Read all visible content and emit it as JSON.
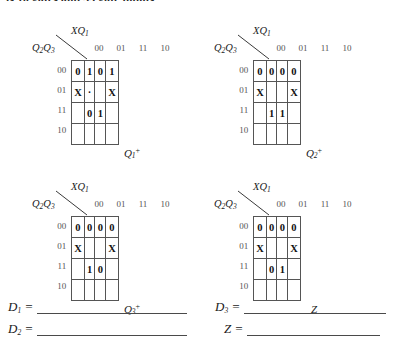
{
  "page": {
    "top_cut_text": "is 10 gates and 33 gate inputs."
  },
  "kmaps": [
    {
      "name": "q1-next",
      "top_var": "XQ",
      "top_var_sub": "1",
      "left_var_a": "Q",
      "left_var_a_sub": "2",
      "left_var_b": "Q",
      "left_var_b_sub": "3",
      "col_heads": [
        "00",
        "01",
        "11",
        "10"
      ],
      "row_heads": [
        "00",
        "01",
        "11",
        "10"
      ],
      "cells": [
        [
          "0",
          "1",
          "0",
          "1"
        ],
        [
          "X",
          "·",
          "",
          "X"
        ],
        [
          "",
          "0",
          "1",
          ""
        ],
        [
          "",
          "",
          "",
          ""
        ]
      ],
      "faint": [
        [
          0,
          0,
          0,
          0
        ],
        [
          0,
          1,
          0,
          0
        ],
        [
          0,
          0,
          0,
          0
        ],
        [
          0,
          0,
          0,
          0
        ]
      ],
      "caption": "Q",
      "caption_sub": "1",
      "caption_sup": "+"
    },
    {
      "name": "q2-next",
      "top_var": "XQ",
      "top_var_sub": "1",
      "left_var_a": "Q",
      "left_var_a_sub": "2",
      "left_var_b": "Q",
      "left_var_b_sub": "3",
      "col_heads": [
        "00",
        "01",
        "11",
        "10"
      ],
      "row_heads": [
        "00",
        "01",
        "11",
        "10"
      ],
      "cells": [
        [
          "0",
          "0",
          "0",
          "0"
        ],
        [
          "X",
          "",
          "",
          "X"
        ],
        [
          "",
          "1",
          "1",
          ""
        ],
        [
          "",
          "",
          "",
          ""
        ]
      ],
      "faint": [
        [
          0,
          0,
          0,
          0
        ],
        [
          0,
          0,
          0,
          0
        ],
        [
          0,
          0,
          0,
          0
        ],
        [
          0,
          0,
          0,
          0
        ]
      ],
      "caption": "Q",
      "caption_sub": "2",
      "caption_sup": "+"
    },
    {
      "name": "q3-next",
      "top_var": "XQ",
      "top_var_sub": "1",
      "left_var_a": "Q",
      "left_var_a_sub": "2",
      "left_var_b": "Q",
      "left_var_b_sub": "3",
      "col_heads": [
        "00",
        "01",
        "11",
        "10"
      ],
      "row_heads": [
        "00",
        "01",
        "11",
        "10"
      ],
      "cells": [
        [
          "0",
          "0",
          "0",
          "0"
        ],
        [
          "X",
          "",
          "",
          "X"
        ],
        [
          "",
          "1",
          "0",
          ""
        ],
        [
          "",
          "",
          "",
          ""
        ]
      ],
      "faint": [
        [
          0,
          0,
          0,
          0
        ],
        [
          0,
          0,
          0,
          0
        ],
        [
          0,
          0,
          0,
          0
        ],
        [
          0,
          0,
          0,
          0
        ]
      ],
      "caption": "Q",
      "caption_sub": "3",
      "caption_sup": "+"
    },
    {
      "name": "z-output",
      "top_var": "XQ",
      "top_var_sub": "1",
      "left_var_a": "Q",
      "left_var_a_sub": "2",
      "left_var_b": "Q",
      "left_var_b_sub": "3",
      "col_heads": [
        "00",
        "01",
        "11",
        "10"
      ],
      "row_heads": [
        "00",
        "01",
        "11",
        "10"
      ],
      "cells": [
        [
          "0",
          "0",
          "0",
          "0"
        ],
        [
          "X",
          "",
          "",
          "X"
        ],
        [
          "",
          "0",
          "1",
          ""
        ],
        [
          "",
          "",
          "",
          ""
        ]
      ],
      "faint": [
        [
          0,
          0,
          0,
          0
        ],
        [
          0,
          0,
          0,
          0
        ],
        [
          0,
          0,
          0,
          0
        ],
        [
          0,
          0,
          0,
          0
        ]
      ],
      "caption": "Z",
      "caption_sub": "",
      "caption_sup": ""
    }
  ],
  "answers": [
    {
      "name": "d1",
      "label": "D",
      "sub": "1",
      "equals": "="
    },
    {
      "name": "d2",
      "label": "D",
      "sub": "2",
      "equals": "="
    },
    {
      "name": "d3",
      "label": "D",
      "sub": "3",
      "equals": "="
    },
    {
      "name": "z",
      "label": "Z",
      "sub": "",
      "equals": "="
    }
  ]
}
